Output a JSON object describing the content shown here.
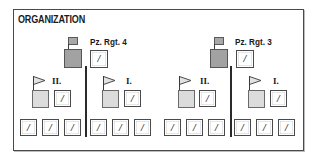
{
  "title": "ORGANIZATION",
  "colors": {
    "regiment_fill": "#a2a2a2",
    "battalion_fill": "#dcdcdc",
    "line": "#2a2a2a",
    "frame": "#4a4a4a"
  },
  "unit_glyph": "/",
  "regiments": [
    {
      "label": "Pz. Rgt. 4",
      "battalions": [
        {
          "label": "II.",
          "companies": [
            "/",
            "/",
            "/"
          ],
          "hq_glyph": "/"
        },
        {
          "label": "I.",
          "companies": [
            "/",
            "/",
            "/"
          ],
          "hq_glyph": "/"
        }
      ],
      "hq_glyph": "/"
    },
    {
      "label": "Pz. Rgt. 3",
      "battalions": [
        {
          "label": "II.",
          "companies": [
            "/",
            "/",
            "/"
          ],
          "hq_glyph": "/"
        },
        {
          "label": "I.",
          "companies": [
            "/",
            "/",
            "/"
          ],
          "hq_glyph": "/"
        }
      ],
      "hq_glyph": "/"
    }
  ]
}
